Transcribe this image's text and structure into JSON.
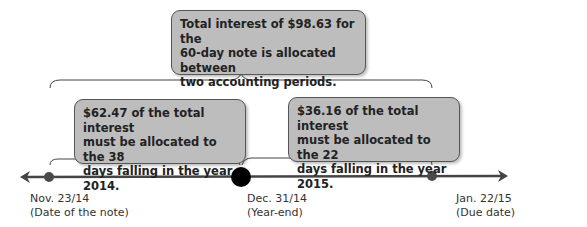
{
  "diagram": {
    "type": "timeline",
    "colors": {
      "callout_fill": "#bdbdbd",
      "callout_border": "#555555",
      "timeline_line": "#444444",
      "start_end_dots": "#4a4a4a",
      "year_end_dot": "#000000",
      "text": "#222222"
    },
    "callouts": {
      "total": "Total interest of $98.63 for the\n60-day note is allocated between\ntwo accounting periods.",
      "period_2014": "$62.47 of the total interest\nmust be allocated to the 38\ndays falling in the year 2014.",
      "period_2015": "$36.16 of the total interest\nmust be allocated to the 22\ndays falling in the year 2015."
    },
    "timeline_points": [
      {
        "date": "Nov. 23/14",
        "note": "(Date of the note)"
      },
      {
        "date": "Dec. 31/14",
        "note": "(Year-end)"
      },
      {
        "date": "Jan. 22/15",
        "note": "(Due date)"
      }
    ],
    "labels": {
      "start": "Nov. 23/14\n(Date of the note)",
      "mid": "Dec. 31/14\n(Year-end)",
      "end": "Jan. 22/15\n(Due date)"
    },
    "values": {
      "total_interest": 98.63,
      "note_days": 60,
      "interest_2014": 62.47,
      "days_2014": 38,
      "interest_2015": 36.16,
      "days_2015": 22
    }
  }
}
